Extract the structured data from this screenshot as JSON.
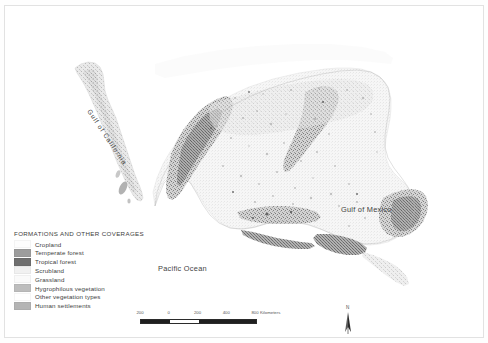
{
  "map": {
    "title": "Land cover and vegetation map of Mexico",
    "labels": [
      {
        "name": "pacific-ocean",
        "text": "Pacific Ocean"
      },
      {
        "name": "gulf-of-mexico",
        "text": "Gulf of Mexico"
      },
      {
        "name": "gulf-of-california",
        "text": "Gulf of California"
      }
    ]
  },
  "legend": {
    "title": "FORMATIONS AND OTHER COVERAGES",
    "items": [
      {
        "label": "Cropland",
        "color": "#fdfdfd"
      },
      {
        "label": "Temperate forest",
        "color": "#9d9d9d"
      },
      {
        "label": "Tropical forest",
        "color": "#6f6f6f"
      },
      {
        "label": "Scrubland",
        "color": "#f1f1f1"
      },
      {
        "label": "Grassland",
        "color": "#fafafa"
      },
      {
        "label": "Hygrophilous vegetation",
        "color": "#bdbdbd"
      },
      {
        "label": "Other vegetation types",
        "color": "#ffffff"
      },
      {
        "label": "Human settlements",
        "color": "#b4b4b4"
      }
    ]
  },
  "scalebar": {
    "ticks": [
      "200",
      "0",
      "200",
      "400",
      "800"
    ],
    "units": "Kilometers"
  },
  "north_arrow": {
    "letter": "N"
  },
  "colors": {
    "land_light": "#f2f2f2",
    "land_mid": "#c9c9c9",
    "land_dark": "#8f8f8f",
    "background": "#ffffff",
    "text": "#3f3f3f"
  }
}
